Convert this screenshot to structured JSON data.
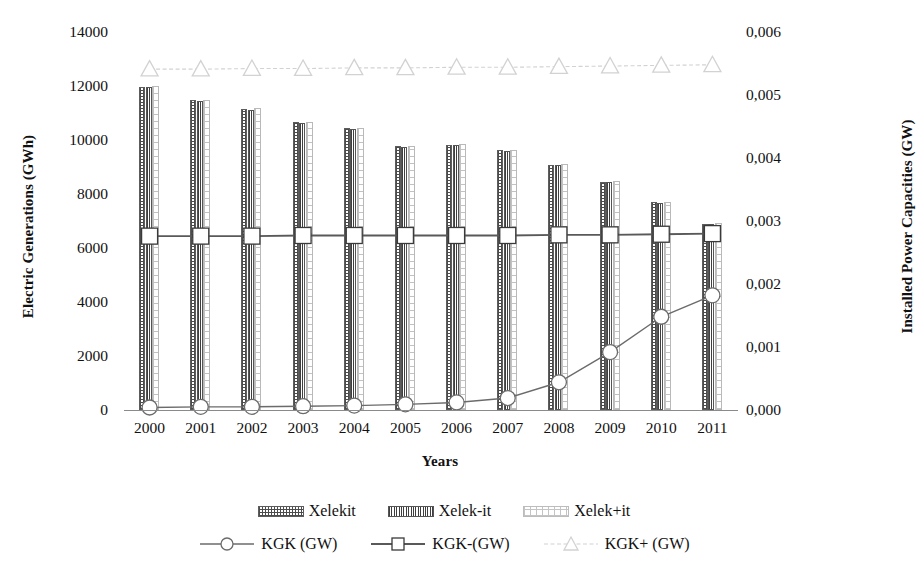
{
  "chart_data": {
    "type": "bar",
    "title": "",
    "xlabel": "Years",
    "ylabel": "Electric Generations (GWh)",
    "y2label": "Installed Power Capacities (GW)",
    "grid": false,
    "legend_position": "bottom",
    "categories": [
      "2000",
      "2001",
      "2002",
      "2003",
      "2004",
      "2005",
      "2006",
      "2007",
      "2008",
      "2009",
      "2010",
      "2011"
    ],
    "ylim": [
      0,
      14000
    ],
    "yticks": [
      "0",
      "2000",
      "4000",
      "6000",
      "8000",
      "10000",
      "12000",
      "14000"
    ],
    "ytick_values": [
      0,
      2000,
      4000,
      6000,
      8000,
      10000,
      12000,
      14000
    ],
    "y2lim": [
      0,
      0.006
    ],
    "y2ticks": [
      "0,000",
      "0,001",
      "0,002",
      "0,003",
      "0,004",
      "0,005",
      "0,006"
    ],
    "y2tick_values": [
      0,
      0.001,
      0.002,
      0.003,
      0.004,
      0.005,
      0.006
    ],
    "series": [
      {
        "name": "Xelekit",
        "kind": "bar",
        "axis": "left",
        "pattern": "dense-dot-hatch",
        "values": [
          11970,
          11480,
          11150,
          10650,
          10430,
          9760,
          9820,
          9620,
          9080,
          8450,
          7700,
          6900
        ]
      },
      {
        "name": "Xelek-it",
        "kind": "bar",
        "axis": "left",
        "pattern": "vertical-line-hatch",
        "values": [
          11950,
          11460,
          11130,
          10630,
          10410,
          9740,
          9800,
          9600,
          9060,
          8430,
          7680,
          6880
        ]
      },
      {
        "name": "Xelek+it",
        "kind": "bar",
        "axis": "left",
        "pattern": "open-grid",
        "values": [
          11990,
          11500,
          11170,
          10670,
          10450,
          9780,
          9840,
          9640,
          9100,
          8470,
          7720,
          6920
        ]
      },
      {
        "name": "KGK (GW)",
        "kind": "line",
        "axis": "right",
        "marker": "circle",
        "values": [
          4e-05,
          5e-05,
          5e-05,
          6e-05,
          7e-05,
          9e-05,
          0.00012,
          0.00019,
          0.00044,
          0.00092,
          0.00148,
          0.00182
        ]
      },
      {
        "name": "KGK-(GW)",
        "kind": "line",
        "axis": "right",
        "marker": "square",
        "values": [
          0.00276,
          0.00276,
          0.00276,
          0.00277,
          0.00277,
          0.00277,
          0.00277,
          0.00277,
          0.00278,
          0.00278,
          0.00279,
          0.0028
        ]
      },
      {
        "name": "KGK+ (GW)",
        "kind": "line",
        "axis": "right",
        "marker": "triangle",
        "values": [
          0.00541,
          0.00541,
          0.00542,
          0.00542,
          0.00543,
          0.00543,
          0.00544,
          0.00544,
          0.00545,
          0.00546,
          0.00547,
          0.00548
        ]
      }
    ]
  },
  "axes": {
    "left_title": "Electric Generations (GWh)",
    "right_title": "Installed Power Capacities (GW)",
    "x_title": "Years"
  },
  "legend": {
    "bars": [
      {
        "label": "Xelekit",
        "swatch": "dense-dot-hatch-swatch"
      },
      {
        "label": "Xelek-it",
        "swatch": "vertical-line-hatch-swatch"
      },
      {
        "label": "Xelek+it",
        "swatch": "open-grid-swatch"
      }
    ],
    "lines": [
      {
        "label": "KGK (GW)",
        "marker": "circle-marker"
      },
      {
        "label": "KGK-(GW)",
        "marker": "square-marker"
      },
      {
        "label": "KGK+ (GW)",
        "marker": "triangle-marker"
      }
    ]
  },
  "colors": {
    "line_dark": "#6b6b6b",
    "line_mid": "#595959",
    "line_light": "#d2d2d2",
    "bar_dark": "#4c4c4c",
    "bar_light": "#c2c2c2",
    "text": "#111111"
  }
}
